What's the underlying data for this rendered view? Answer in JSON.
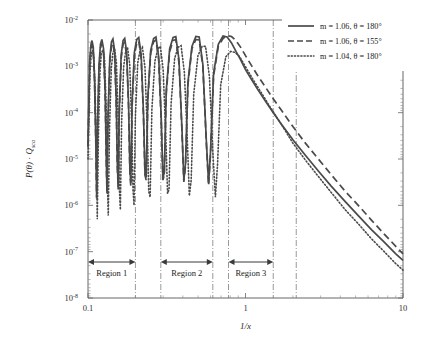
{
  "chart_data": {
    "type": "line",
    "title": "",
    "xlabel": "1/x",
    "ylabel": "P(θ) · Q_sca",
    "xscale": "log",
    "yscale": "log",
    "xlim": [
      0.1,
      10
    ],
    "ylim": [
      1e-08,
      0.01
    ],
    "grid": false,
    "legend_position": "top-right",
    "xticklabels": [
      "0.1",
      "1",
      "10"
    ],
    "xtickvalues": [
      0.1,
      1,
      10
    ],
    "yticklabels": [
      "10-2",
      "10-3",
      "10-4",
      "10-5",
      "10-6",
      "10-7",
      "10-8"
    ],
    "ytickexponents": [
      "-2",
      "-3",
      "-4",
      "-5",
      "-6",
      "-7",
      "-8"
    ],
    "ytickmantissa": "10",
    "ytickvalues": [
      0.01,
      0.001,
      0.0001,
      1e-05,
      1e-06,
      1e-07,
      1e-08
    ],
    "series": [
      {
        "name": "m = 1.06, θ = 180°",
        "style": "solid",
        "m": "1.06",
        "theta": "180°",
        "color": "#4a4a4a",
        "points": [
          [
            0.1,
            2e-05
          ],
          [
            0.1025,
            0.0013
          ],
          [
            0.1045,
            0.003
          ],
          [
            0.106,
            0.0036
          ],
          [
            0.108,
            0.0026
          ],
          [
            0.11,
            0.0006
          ],
          [
            0.112,
            3e-05
          ],
          [
            0.1135,
            1.5e-06
          ],
          [
            0.115,
            6e-05
          ],
          [
            0.1175,
            0.0011
          ],
          [
            0.12,
            0.003
          ],
          [
            0.1225,
            0.0038
          ],
          [
            0.1255,
            0.0024
          ],
          [
            0.1285,
            0.0003
          ],
          [
            0.1305,
            1.2e-05
          ],
          [
            0.132,
            2e-06
          ],
          [
            0.134,
            8e-05
          ],
          [
            0.1375,
            0.0015
          ],
          [
            0.141,
            0.0034
          ],
          [
            0.144,
            0.0039
          ],
          [
            0.1475,
            0.0022
          ],
          [
            0.151,
            0.0002
          ],
          [
            0.1535,
            8e-06
          ],
          [
            0.1555,
            2.5e-06
          ],
          [
            0.158,
            0.00012
          ],
          [
            0.1625,
            0.0018
          ],
          [
            0.167,
            0.0036
          ],
          [
            0.171,
            0.004
          ],
          [
            0.176,
            0.002
          ],
          [
            0.181,
            0.00015
          ],
          [
            0.1845,
            6e-06
          ],
          [
            0.187,
            3e-06
          ],
          [
            0.1905,
            0.00016
          ],
          [
            0.197,
            0.002
          ],
          [
            0.204,
            0.0038
          ],
          [
            0.21,
            0.0042
          ],
          [
            0.2175,
            0.0018
          ],
          [
            0.225,
            0.0001
          ],
          [
            0.23,
            5e-06
          ],
          [
            0.234,
            4e-06
          ],
          [
            0.24,
            0.00022
          ],
          [
            0.25,
            0.0022
          ],
          [
            0.261,
            0.004
          ],
          [
            0.27,
            0.0043
          ],
          [
            0.281,
            0.0016
          ],
          [
            0.292,
            7e-05
          ],
          [
            0.299,
            4e-06
          ],
          [
            0.305,
            5e-06
          ],
          [
            0.314,
            0.0003
          ],
          [
            0.33,
            0.0024
          ],
          [
            0.347,
            0.0042
          ],
          [
            0.361,
            0.0044
          ],
          [
            0.378,
            0.0014
          ],
          [
            0.395,
            4.5e-05
          ],
          [
            0.406,
            3.5e-06
          ],
          [
            0.416,
            8e-06
          ],
          [
            0.431,
            0.00045
          ],
          [
            0.457,
            0.0027
          ],
          [
            0.484,
            0.0044
          ],
          [
            0.508,
            0.0043
          ],
          [
            0.536,
            0.0011
          ],
          [
            0.564,
            2.5e-05
          ],
          [
            0.583,
            3e-06
          ],
          [
            0.6,
            1.5e-05
          ],
          [
            0.627,
            0.0007
          ],
          [
            0.672,
            0.003
          ],
          [
            0.72,
            0.0045
          ],
          [
            0.765,
            0.0043
          ],
          [
            0.815,
            0.0032
          ],
          [
            0.87,
            0.0021
          ],
          [
            0.93,
            0.0014
          ],
          [
            1.0,
            0.00085
          ],
          [
            1.1,
            0.0005
          ],
          [
            1.2,
            0.00031
          ],
          [
            1.35,
            0.00017
          ],
          [
            1.5,
            0.0001
          ],
          [
            1.7,
            5.5e-05
          ],
          [
            2.0,
            2.6e-05
          ],
          [
            2.4,
            1.2e-05
          ],
          [
            2.9,
            5.5e-06
          ],
          [
            3.5,
            2.6e-06
          ],
          [
            4.3,
            1.2e-06
          ],
          [
            5.2,
            6e-07
          ],
          [
            6.3,
            3e-07
          ],
          [
            7.6,
            1.6e-07
          ],
          [
            9.0,
            9e-08
          ],
          [
            10.0,
            6.5e-08
          ]
        ]
      },
      {
        "name": "m = 1.06, θ = 155°",
        "style": "dashed",
        "m": "1.06",
        "theta": "155°",
        "color": "#4a4a4a",
        "points": [
          [
            0.1,
            1.8e-05
          ],
          [
            0.1025,
            0.0011
          ],
          [
            0.1045,
            0.0025
          ],
          [
            0.106,
            0.0029
          ],
          [
            0.108,
            0.0021
          ],
          [
            0.11,
            0.0005
          ],
          [
            0.112,
            2.6e-05
          ],
          [
            0.1135,
            1.4e-06
          ],
          [
            0.115,
            5e-05
          ],
          [
            0.1175,
            0.0009
          ],
          [
            0.12,
            0.0025
          ],
          [
            0.1225,
            0.0031
          ],
          [
            0.1255,
            0.002
          ],
          [
            0.1285,
            0.00026
          ],
          [
            0.1305,
            1e-05
          ],
          [
            0.132,
            1.8e-06
          ],
          [
            0.134,
            6.5e-05
          ],
          [
            0.1375,
            0.0012
          ],
          [
            0.141,
            0.0028
          ],
          [
            0.144,
            0.0032
          ],
          [
            0.1475,
            0.0018
          ],
          [
            0.151,
            0.00017
          ],
          [
            0.1535,
            7e-06
          ],
          [
            0.1555,
            2.2e-06
          ],
          [
            0.158,
            0.0001
          ],
          [
            0.1625,
            0.0015
          ],
          [
            0.167,
            0.003
          ],
          [
            0.171,
            0.0033
          ],
          [
            0.176,
            0.0017
          ],
          [
            0.181,
            0.00013
          ],
          [
            0.1845,
            5e-06
          ],
          [
            0.187,
            2.6e-06
          ],
          [
            0.1905,
            0.00013
          ],
          [
            0.197,
            0.0017
          ],
          [
            0.204,
            0.0032
          ],
          [
            0.21,
            0.0035
          ],
          [
            0.2175,
            0.0015
          ],
          [
            0.225,
            8.5e-05
          ],
          [
            0.23,
            4.5e-06
          ],
          [
            0.234,
            3.5e-06
          ],
          [
            0.24,
            0.00019
          ],
          [
            0.25,
            0.0019
          ],
          [
            0.261,
            0.0034
          ],
          [
            0.27,
            0.0037
          ],
          [
            0.281,
            0.0014
          ],
          [
            0.292,
            6e-05
          ],
          [
            0.299,
            3.5e-06
          ],
          [
            0.305,
            4.5e-06
          ],
          [
            0.314,
            0.00026
          ],
          [
            0.33,
            0.0021
          ],
          [
            0.347,
            0.0036
          ],
          [
            0.361,
            0.0038
          ],
          [
            0.378,
            0.0012
          ],
          [
            0.395,
            4e-05
          ],
          [
            0.406,
            3.2e-06
          ],
          [
            0.416,
            7e-06
          ],
          [
            0.431,
            0.0004
          ],
          [
            0.457,
            0.0024
          ],
          [
            0.484,
            0.0038
          ],
          [
            0.508,
            0.0037
          ],
          [
            0.536,
            0.001
          ],
          [
            0.564,
            2.2e-05
          ],
          [
            0.583,
            2.7e-06
          ],
          [
            0.6,
            1.3e-05
          ],
          [
            0.627,
            0.00062
          ],
          [
            0.672,
            0.0027
          ],
          [
            0.72,
            0.004
          ],
          [
            0.765,
            0.0046
          ],
          [
            0.815,
            0.0044
          ],
          [
            0.87,
            0.0036
          ],
          [
            0.93,
            0.0026
          ],
          [
            1.0,
            0.0017
          ],
          [
            1.1,
            0.001
          ],
          [
            1.2,
            0.00062
          ],
          [
            1.35,
            0.00034
          ],
          [
            1.5,
            0.0002
          ],
          [
            1.7,
            0.00011
          ],
          [
            2.0,
            5e-05
          ],
          [
            2.4,
            2.2e-05
          ],
          [
            2.9,
            1e-05
          ],
          [
            3.5,
            4.6e-06
          ],
          [
            4.3,
            2e-06
          ],
          [
            5.2,
            1e-06
          ],
          [
            6.3,
            4.8e-07
          ],
          [
            7.6,
            2.4e-07
          ],
          [
            9.0,
            1.3e-07
          ],
          [
            10.0,
            9e-08
          ]
        ]
      },
      {
        "name": "m = 1.04, θ = 180°",
        "style": "dotted",
        "m": "1.04",
        "theta": "180°",
        "color": "#4a4a4a",
        "points": [
          [
            0.1,
            1e-05
          ],
          [
            0.103,
            0.0008
          ],
          [
            0.105,
            0.0019
          ],
          [
            0.107,
            0.0022
          ],
          [
            0.109,
            0.0015
          ],
          [
            0.111,
            0.0003
          ],
          [
            0.113,
            1.2e-05
          ],
          [
            0.1145,
            5e-07
          ],
          [
            0.1165,
            3.5e-05
          ],
          [
            0.119,
            0.0007
          ],
          [
            0.1215,
            0.0019
          ],
          [
            0.1245,
            0.0023
          ],
          [
            0.1275,
            0.0014
          ],
          [
            0.1305,
            0.00013
          ],
          [
            0.1325,
            4e-06
          ],
          [
            0.1345,
            6e-07
          ],
          [
            0.137,
            4.5e-05
          ],
          [
            0.1405,
            0.0009
          ],
          [
            0.144,
            0.002
          ],
          [
            0.1475,
            0.0024
          ],
          [
            0.1515,
            0.0012
          ],
          [
            0.1555,
            7e-05
          ],
          [
            0.158,
            2.5e-06
          ],
          [
            0.1605,
            8e-07
          ],
          [
            0.1635,
            6.5e-05
          ],
          [
            0.1685,
            0.001
          ],
          [
            0.1735,
            0.0021
          ],
          [
            0.1785,
            0.0025
          ],
          [
            0.184,
            0.0011
          ],
          [
            0.1895,
            5.5e-05
          ],
          [
            0.193,
            2.2e-06
          ],
          [
            0.196,
            1e-06
          ],
          [
            0.2,
            8.5e-05
          ],
          [
            0.207,
            0.0012
          ],
          [
            0.2145,
            0.0023
          ],
          [
            0.2215,
            0.0026
          ],
          [
            0.23,
            0.00095
          ],
          [
            0.238,
            4e-05
          ],
          [
            0.243,
            2e-06
          ],
          [
            0.248,
            1.5e-06
          ],
          [
            0.2545,
            0.00012
          ],
          [
            0.266,
            0.0013
          ],
          [
            0.278,
            0.0024
          ],
          [
            0.288,
            0.0027
          ],
          [
            0.3,
            0.00085
          ],
          [
            0.312,
            3e-05
          ],
          [
            0.32,
            1.8e-06
          ],
          [
            0.327,
            2.2e-06
          ],
          [
            0.337,
            0.00016
          ],
          [
            0.355,
            0.0015
          ],
          [
            0.374,
            0.0026
          ],
          [
            0.39,
            0.0028
          ],
          [
            0.409,
            0.00075
          ],
          [
            0.428,
            2.2e-05
          ],
          [
            0.44,
            1.6e-06
          ],
          [
            0.452,
            3.5e-06
          ],
          [
            0.469,
            0.00025
          ],
          [
            0.499,
            0.0017
          ],
          [
            0.53,
            0.0027
          ],
          [
            0.558,
            0.0027
          ],
          [
            0.59,
            0.0006
          ],
          [
            0.622,
            1.2e-05
          ],
          [
            0.644,
            1.5e-06
          ],
          [
            0.665,
            8e-06
          ],
          [
            0.696,
            0.0004
          ],
          [
            0.75,
            0.0016
          ],
          [
            0.805,
            0.0021
          ],
          [
            0.86,
            0.002
          ],
          [
            0.92,
            0.0016
          ],
          [
            0.98,
            0.0011
          ],
          [
            1.06,
            0.0007
          ],
          [
            1.15,
            0.00044
          ],
          [
            1.26,
            0.00027
          ],
          [
            1.4,
            0.00015
          ],
          [
            1.56,
            8.5e-05
          ],
          [
            1.75,
            4.6e-05
          ],
          [
            2.0,
            2.2e-05
          ],
          [
            2.4,
            9.5e-06
          ],
          [
            2.9,
            4.2e-06
          ],
          [
            3.5,
            1.9e-06
          ],
          [
            4.3,
            8e-07
          ],
          [
            5.2,
            4e-07
          ],
          [
            6.3,
            1.9e-07
          ],
          [
            7.6,
            1e-07
          ],
          [
            9.0,
            5.5e-08
          ],
          [
            10.0,
            4e-08
          ]
        ]
      }
    ],
    "region_separators": [
      0.2,
      0.29,
      0.62,
      0.78,
      1.5,
      2.1
    ],
    "regions": [
      {
        "label": "Region 1",
        "start": 0.1,
        "end": 0.2
      },
      {
        "label": "Region 2",
        "start": 0.29,
        "end": 0.62
      },
      {
        "label": "Region 3",
        "start": 0.78,
        "end": 1.5
      }
    ]
  },
  "legend": {
    "entries": [
      {
        "style": "solid",
        "text": "m = 1.06, θ = 180°"
      },
      {
        "style": "dashed",
        "text": "m = 1.06, θ = 155°"
      },
      {
        "style": "dotted",
        "text": "m = 1.04, θ = 180°"
      }
    ]
  },
  "colors": {
    "curve": "#4a4a4a",
    "axis": "#555555",
    "separator": "#777777",
    "background": "#ffffff"
  }
}
